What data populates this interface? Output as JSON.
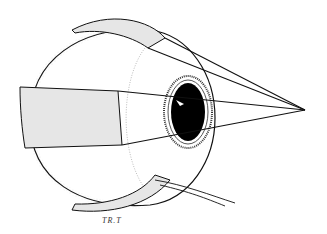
{
  "figure": {
    "signature": "TR.T",
    "colors": {
      "outline": "#111111",
      "shade": "#e6e6e6",
      "pupil": "#000000",
      "background": "#ffffff"
    }
  }
}
